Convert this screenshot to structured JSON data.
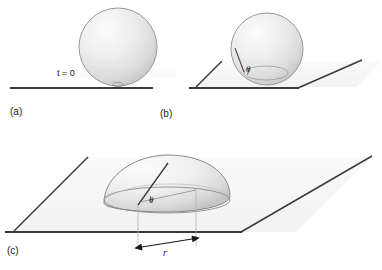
{
  "figure": {
    "type": "schematic-diagram",
    "background_color": "#ffffff",
    "line_color": "#3a3a3a",
    "drop_fill_light": "#f4f4f4",
    "drop_fill_dark": "#c9c9c9",
    "plane_fill": "#f7f7f7"
  },
  "panels": [
    {
      "id": "a",
      "label": "(a)",
      "time_label": "t = 0",
      "shape": "sphere",
      "description": "spherical droplet touching the surface"
    },
    {
      "id": "b",
      "label": "(b)",
      "angle_symbol": "θ",
      "shape": "sphere-on-plane",
      "description": "droplet beginning to wet the surface, contact angle theta"
    },
    {
      "id": "c",
      "label": "(c)",
      "angle_symbol": "θ",
      "radius_label": "r",
      "shape": "spherical-cap",
      "description": "spread droplet forming a spherical cap of contact radius r"
    }
  ],
  "annotations": {
    "panel_a_time": "t = 0",
    "panel_b_theta": "θ",
    "panel_c_theta": "θ",
    "panel_c_radius": "r",
    "label_a": "(a)",
    "label_b": "(b)",
    "label_c": "(c)"
  }
}
